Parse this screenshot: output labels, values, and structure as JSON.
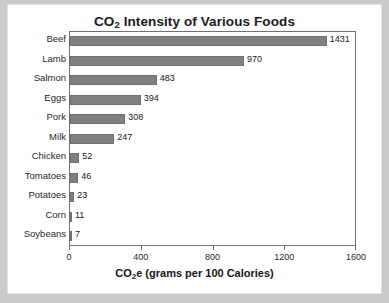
{
  "chart_data": {
    "type": "bar",
    "orientation": "horizontal",
    "title": "CO",
    "title_sub": "2",
    "title_rest": " Intensity of Various Foods",
    "title_full": "CO2 Intensity of Various Foods",
    "categories": [
      "Beef",
      "Lamb",
      "Salmon",
      "Eggs",
      "Pork",
      "Milk",
      "Chicken",
      "Tomatoes",
      "Potatoes",
      "Corn",
      "Soybeans"
    ],
    "values": [
      1431,
      970,
      483,
      394,
      308,
      247,
      52,
      46,
      23,
      11,
      7
    ],
    "value_labels": [
      "1431",
      "970",
      "483",
      "394",
      "308",
      "247",
      "52",
      "46",
      "23",
      "11",
      "7"
    ],
    "xlabel_prefix": "CO",
    "xlabel_sub": "2",
    "xlabel_rest": "e (grams per 100 Calories)",
    "xlabel_full": "CO2e (grams per 100 Calories)",
    "ylabel": "",
    "xlim": [
      0,
      1600
    ],
    "xticks": [
      0,
      400,
      800,
      1200,
      1600
    ],
    "xtick_labels": [
      "0",
      "400",
      "800",
      "1200",
      "1600"
    ],
    "grid": false,
    "legend": false,
    "bar_color": "#808080",
    "bar_edge_color": "#707070",
    "frame_color": "#6f6f6f",
    "text_color": "#1f1f1f",
    "background": "#ffffff",
    "page_background": "#c9cbcd"
  }
}
